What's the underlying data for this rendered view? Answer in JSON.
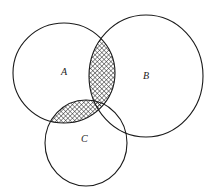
{
  "diagram": {
    "type": "venn",
    "sets": [
      {
        "id": "A",
        "label": "A",
        "cx": 64,
        "cy": 73,
        "rx": 51,
        "ry": 50,
        "label_x": 63,
        "label_y": 74
      },
      {
        "id": "B",
        "label": "B",
        "cx": 146,
        "cy": 76,
        "rx": 57,
        "ry": 61,
        "label_x": 145,
        "label_y": 78
      },
      {
        "id": "C",
        "label": "C",
        "cx": 86,
        "cy": 143,
        "rx": 41,
        "ry": 43,
        "label_x": 84,
        "label_y": 141
      }
    ],
    "shaded_regions": [
      "A∩B",
      "A∩C"
    ],
    "shading": "cross-hatch",
    "stroke_color": "#1a1a1a",
    "hatch_color": "#1a1a1a",
    "background": "#ffffff"
  }
}
